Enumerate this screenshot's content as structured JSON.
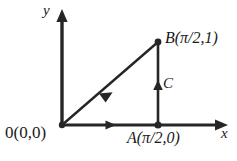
{
  "figure": {
    "background_color": "#ffffff",
    "stroke_color": "#262626",
    "axes": {
      "x_axis_label": "x",
      "y_axis_label": "y",
      "origin_label": "0(0,0)"
    },
    "points": {
      "origin": {
        "name": "0",
        "coords": "(0,0)",
        "label": "0(0,0)",
        "x_px": 62,
        "y_px": 125
      },
      "a": {
        "name": "A",
        "coords": "(π/2,0)",
        "label": "A(π/2,0)",
        "x_px": 158,
        "y_px": 125
      },
      "b": {
        "name": "B",
        "coords": "(π/2,1)",
        "label": "B(π/2,1)",
        "x_px": 158,
        "y_px": 42
      },
      "c": {
        "name": "C",
        "coords": "",
        "label": "C",
        "x_px": 158,
        "y_px": 85
      }
    },
    "segments": [
      {
        "name": "hypotenuse",
        "from": "origin",
        "to": "b",
        "arrow": "midpoint-toward-origin"
      },
      {
        "name": "vertical-leg",
        "from": "a",
        "to": "b",
        "arrow": "midpoint-upward"
      },
      {
        "name": "horizontal-leg",
        "from": "origin",
        "to": "a",
        "arrow": "midpoint-rightward"
      }
    ]
  }
}
